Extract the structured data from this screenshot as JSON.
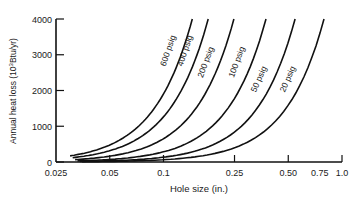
{
  "chart_data": {
    "type": "line",
    "title": "",
    "xlabel": "Hole size (in.)",
    "ylabel": "Annual heat loss (10^3Btu/yr)",
    "ylabel_parts": {
      "main": "Annual heat loss (10",
      "sup": "3",
      "tail": "Btu/yr)"
    },
    "x_scale": "log",
    "xlim": [
      0.025,
      1.0
    ],
    "ylim": [
      0,
      4000
    ],
    "x_ticks": [
      0.025,
      0.05,
      0.1,
      0.25,
      0.5,
      1.0
    ],
    "x_tick_labels": [
      "0.025",
      "0.05",
      "0.1",
      "0.25",
      "0.50",
      "0.75",
      "1.0"
    ],
    "x_tick_label_values": [
      0.025,
      0.05,
      0.1,
      0.25,
      0.5,
      0.75,
      1.0
    ],
    "y_ticks": [
      0,
      1000,
      2000,
      3000,
      4000
    ],
    "y_tick_labels": [
      "0",
      "1000",
      "2000",
      "3000",
      "4000"
    ],
    "grid": false,
    "legend": "inline curve labels",
    "series": [
      {
        "name": "600 psig",
        "x": [
          0.03,
          0.05,
          0.0725,
          0.1,
          0.125,
          0.145
        ],
        "values": [
          171,
          476,
          1000,
          1902,
          2973,
          4000
        ]
      },
      {
        "name": "400 psig",
        "x": [
          0.03,
          0.05,
          0.089,
          0.1,
          0.15,
          0.178
        ],
        "values": [
          114,
          316,
          1000,
          1262,
          2840,
          4000
        ]
      },
      {
        "name": "200 psig",
        "x": [
          0.03,
          0.05,
          0.1,
          0.124,
          0.2,
          0.248
        ],
        "values": [
          59,
          163,
          650,
          1000,
          2601,
          4000
        ]
      },
      {
        "name": "100 psig",
        "x": [
          0.03,
          0.05,
          0.1,
          0.1875,
          0.25,
          0.375
        ],
        "values": [
          26,
          71,
          284,
          1000,
          1778,
          4000
        ]
      },
      {
        "name": "50 psig",
        "x": [
          0.03,
          0.05,
          0.1,
          0.25,
          0.273,
          0.546
        ],
        "values": [
          12,
          34,
          134,
          838,
          1000,
          4000
        ]
      },
      {
        "name": "20 psig",
        "x": [
          0.03,
          0.05,
          0.1,
          0.25,
          0.397,
          0.793
        ],
        "values": [
          6,
          16,
          64,
          398,
          1000,
          4000
        ]
      }
    ]
  }
}
